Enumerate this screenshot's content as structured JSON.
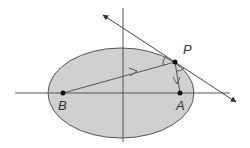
{
  "diagram": {
    "type": "ellipse-reflection",
    "colors": {
      "ellipse_fill": "#d0d0d0",
      "stroke": "#555555",
      "point": "#111111",
      "label": "#333333"
    },
    "points": {
      "B": {
        "label": "B",
        "x": 63,
        "y": 93
      },
      "A": {
        "label": "A",
        "x": 180,
        "y": 93
      },
      "P": {
        "label": "P",
        "x": 175,
        "y": 62
      }
    },
    "labels": {
      "P": "P",
      "A": "A",
      "B": "B"
    }
  }
}
